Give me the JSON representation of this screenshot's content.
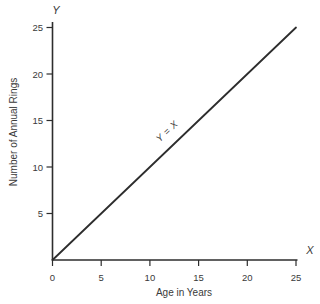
{
  "figure": {
    "background": "#ffffff",
    "ink_color": "#2d2d2d",
    "text_color": "#3a3a3a"
  },
  "chart_data": {
    "type": "line",
    "title": "",
    "xlabel": "Age in Years",
    "ylabel": "Number of Annual Rings",
    "x_axis_letter": "X",
    "y_axis_letter": "Y",
    "xlim": [
      0,
      25
    ],
    "ylim": [
      0,
      25
    ],
    "x_ticks": [
      0,
      5,
      10,
      15,
      20,
      25
    ],
    "y_ticks": [
      5,
      10,
      15,
      20,
      25
    ],
    "grid": false,
    "legend": false,
    "series": [
      {
        "name": "Y = X",
        "x": [
          0,
          25
        ],
        "y": [
          0,
          25
        ],
        "color": "#2d2d2d",
        "annotation": "Y = X",
        "annotation_at": {
          "x": 12,
          "y": 13.6
        }
      }
    ]
  }
}
